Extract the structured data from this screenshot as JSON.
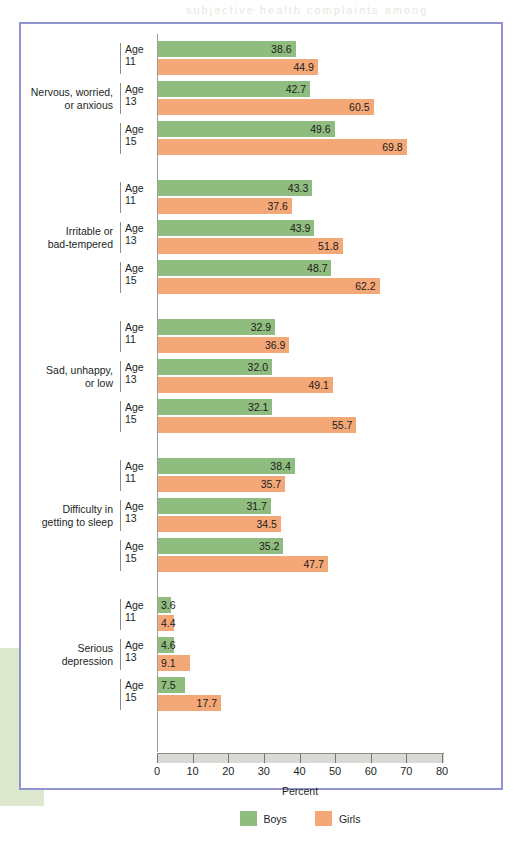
{
  "figure": {
    "axis_title": "Percent",
    "colors": {
      "boys": "#8ebd7f",
      "girls": "#f4a878",
      "frame": "#9096cd",
      "axis_band": "#d9d9d6",
      "margin_block": "#dde8cf"
    }
  },
  "legend": {
    "position": "bottom-center",
    "items": [
      {
        "label": "Boys",
        "color": "#8ebd7f"
      },
      {
        "label": "Girls",
        "color": "#f4a878"
      }
    ]
  },
  "axis": {
    "ticks": [
      "0",
      "10",
      "20",
      "30",
      "40",
      "50",
      "60",
      "70",
      "80"
    ],
    "min": 0,
    "max": 80
  },
  "bleed": [
    {
      "text": "subjective health complaints among",
      "x": 186,
      "y": 4
    }
  ],
  "chart_data": {
    "type": "bar",
    "orientation": "horizontal",
    "title": "",
    "xlabel": "Percent",
    "ylabel": "",
    "xlim": [
      0,
      80
    ],
    "grid": false,
    "legend_position": "bottom-center",
    "categories": [
      "Nervous, worried, or anxious",
      "Irritable or bad-tempered",
      "Sad, unhappy, or low",
      "Difficulty in getting to sleep",
      "Serious depression"
    ],
    "subcategories": [
      "Age 11",
      "Age 13",
      "Age 15"
    ],
    "series": [
      {
        "name": "Boys",
        "color": "#8ebd7f"
      },
      {
        "name": "Girls",
        "color": "#f4a878"
      }
    ],
    "groups": [
      {
        "label_line1": "Nervous, worried,",
        "label_line2": "or anxious",
        "rows": [
          {
            "age_line1": "Age",
            "age_line2": "11",
            "boys": 38.6,
            "girls": 44.9
          },
          {
            "age_line1": "Age",
            "age_line2": "13",
            "boys": 42.7,
            "girls": 60.5
          },
          {
            "age_line1": "Age",
            "age_line2": "15",
            "boys": 49.6,
            "girls": 69.8
          }
        ]
      },
      {
        "label_line1": "Irritable or",
        "label_line2": "bad-tempered",
        "rows": [
          {
            "age_line1": "Age",
            "age_line2": "11",
            "boys": 43.3,
            "girls": 37.6
          },
          {
            "age_line1": "Age",
            "age_line2": "13",
            "boys": 43.9,
            "girls": 51.8
          },
          {
            "age_line1": "Age",
            "age_line2": "15",
            "boys": 48.7,
            "girls": 62.2
          }
        ]
      },
      {
        "label_line1": "Sad, unhappy,",
        "label_line2": "or low",
        "rows": [
          {
            "age_line1": "Age",
            "age_line2": "11",
            "boys": 32.9,
            "girls": 36.9
          },
          {
            "age_line1": "Age",
            "age_line2": "13",
            "boys": 32.0,
            "girls": 49.1
          },
          {
            "age_line1": "Age",
            "age_line2": "15",
            "boys": 32.1,
            "girls": 55.7
          }
        ]
      },
      {
        "label_line1": "Difficulty in",
        "label_line2": "getting to sleep",
        "rows": [
          {
            "age_line1": "Age",
            "age_line2": "11",
            "boys": 38.4,
            "girls": 35.7
          },
          {
            "age_line1": "Age",
            "age_line2": "13",
            "boys": 31.7,
            "girls": 34.5
          },
          {
            "age_line1": "Age",
            "age_line2": "15",
            "boys": 35.2,
            "girls": 47.7
          }
        ]
      },
      {
        "label_line1": "Serious",
        "label_line2": "depression",
        "rows": [
          {
            "age_line1": "Age",
            "age_line2": "11",
            "boys": 3.6,
            "girls": 4.4
          },
          {
            "age_line1": "Age",
            "age_line2": "13",
            "boys": 4.6,
            "girls": 9.1
          },
          {
            "age_line1": "Age",
            "age_line2": "15",
            "boys": 7.5,
            "girls": 17.7
          }
        ]
      }
    ]
  }
}
